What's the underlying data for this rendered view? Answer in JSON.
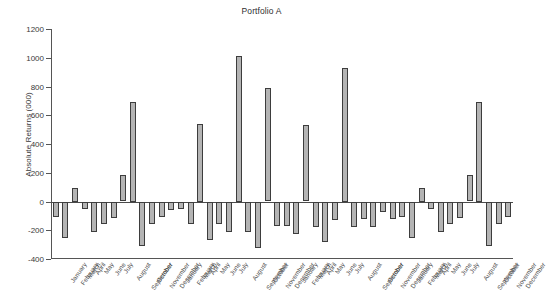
{
  "chart_data": {
    "type": "bar",
    "title": "Portfolio A",
    "xlabel": "",
    "ylabel": "Absolute Returns (000)",
    "ylim": [
      -400,
      1200
    ],
    "yticks": [
      -400,
      -200,
      0,
      200,
      400,
      600,
      800,
      1000,
      1200
    ],
    "ytick_labels": [
      "-400",
      "-200",
      "0",
      "200",
      "400",
      "600",
      "800",
      "1000",
      "1200"
    ],
    "grid": false,
    "legend": null,
    "bar_fill_color": "#b4b4b4",
    "bar_edge_color": "#3d3d3d",
    "categories": [
      "January",
      "February",
      "March",
      "April",
      "May",
      "June",
      "July",
      "August",
      "September",
      "October",
      "November",
      "December",
      "January",
      "February",
      "March",
      "April",
      "May",
      "June",
      "July",
      "August",
      "September",
      "October",
      "November",
      "December",
      "January",
      "February",
      "March",
      "April",
      "May",
      "June",
      "July",
      "August",
      "September",
      "October",
      "November",
      "December",
      "January",
      "February",
      "March",
      "April",
      "May",
      "June",
      "July",
      "August",
      "September",
      "October",
      "November",
      "December"
    ],
    "values": [
      -105,
      -255,
      95,
      -55,
      -210,
      -155,
      -115,
      183,
      695,
      -310,
      -158,
      -105,
      -60,
      -50,
      -158,
      540,
      -265,
      -158,
      -215,
      1010,
      -215,
      -325,
      787,
      -170,
      -168,
      -228,
      532,
      -180,
      -283,
      -130,
      930,
      -178,
      -120,
      -175,
      -75,
      -125,
      -105,
      -255,
      95,
      -55,
      -210,
      -155,
      -115,
      183,
      695,
      -310,
      -158,
      -105
    ],
    "n_bars": 48
  }
}
